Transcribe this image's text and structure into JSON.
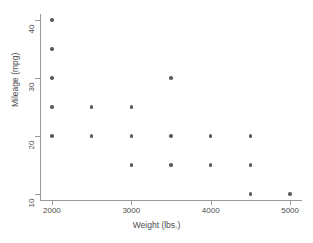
{
  "chart_data": {
    "type": "scatter",
    "title": "",
    "xlabel": "Weight (lbs.)",
    "ylabel": "Mileage (mpg)",
    "xlim": [
      1850,
      5150
    ],
    "ylim": [
      9,
      41
    ],
    "grid": false,
    "legend": null,
    "xticks": [
      2000,
      3000,
      4000,
      5000
    ],
    "xtick_labels": [
      "2000",
      "3000",
      "4000",
      "5000"
    ],
    "yticks": [
      10,
      20,
      30,
      40
    ],
    "ytick_labels": [
      "10",
      "20",
      "30",
      "40"
    ],
    "marker_color": "#5a5a5a",
    "axis_color": "#9a9a9a",
    "points": [
      {
        "x": 2000,
        "y": 40
      },
      {
        "x": 2000,
        "y": 35
      },
      {
        "x": 2000,
        "y": 30
      },
      {
        "x": 2000,
        "y": 25
      },
      {
        "x": 2000,
        "y": 20
      },
      {
        "x": 2500,
        "y": 25
      },
      {
        "x": 2500,
        "y": 20
      },
      {
        "x": 3000,
        "y": 25
      },
      {
        "x": 3000,
        "y": 20
      },
      {
        "x": 3000,
        "y": 15
      },
      {
        "x": 3500,
        "y": 30
      },
      {
        "x": 3500,
        "y": 20
      },
      {
        "x": 3500,
        "y": 15
      },
      {
        "x": 4000,
        "y": 20
      },
      {
        "x": 4000,
        "y": 15
      },
      {
        "x": 4500,
        "y": 20
      },
      {
        "x": 4500,
        "y": 15
      },
      {
        "x": 4500,
        "y": 10
      },
      {
        "x": 5000,
        "y": 10
      }
    ]
  }
}
